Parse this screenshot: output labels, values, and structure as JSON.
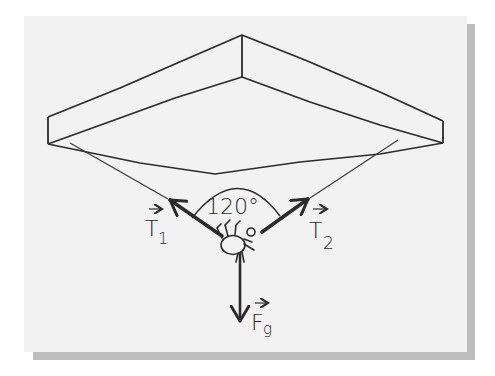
{
  "diagram": {
    "angle_label": "120°",
    "vectors": [
      {
        "id": "T1",
        "symbol": "T",
        "subscript": "1",
        "direction": "up-left"
      },
      {
        "id": "T2",
        "symbol": "T",
        "subscript": "2",
        "direction": "up-right"
      },
      {
        "id": "Fg",
        "symbol": "F",
        "subscript": "g",
        "direction": "down"
      }
    ],
    "colors": {
      "ink": "#2b2b2b",
      "panel": "#f2f2f2",
      "shadow": "#bdbdbd"
    }
  }
}
